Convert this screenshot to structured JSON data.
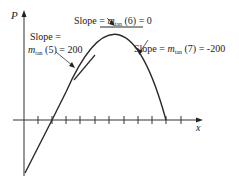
{
  "diagram": {
    "axis_labels": {
      "y": "P",
      "x": "x"
    },
    "annotations": {
      "left_line1": "Slope =",
      "left_m": "m",
      "left_sub": "tan",
      "left_rest": " (5) = 200",
      "top_prefix": "Slope = ",
      "top_m": "m",
      "top_sub": "tan",
      "top_rest": " (6) = 0",
      "right_prefix": "Slope = ",
      "right_m": "m",
      "right_sub": "tan",
      "right_rest": " (7) = -200"
    },
    "tick_count": 11,
    "colors": {
      "stroke": "#2a2a2a",
      "background": "#ffffff"
    }
  }
}
